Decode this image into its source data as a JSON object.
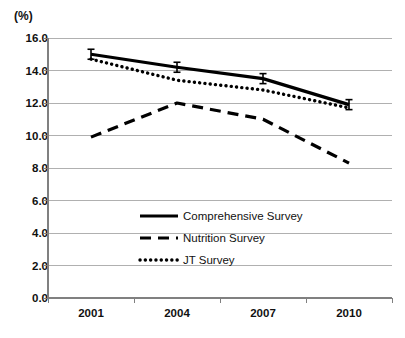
{
  "chart_data": {
    "type": "line",
    "title": "",
    "subtitle": "",
    "xlabel": "",
    "ylabel": "(%)",
    "unit_label": "(%)",
    "categories": [
      "2001",
      "2004",
      "2007",
      "2010"
    ],
    "x": [
      2001,
      2004,
      2007,
      2010
    ],
    "ylim": [
      0.0,
      16.0
    ],
    "ytick_values": [
      0.0,
      2.0,
      4.0,
      6.0,
      8.0,
      10.0,
      12.0,
      14.0,
      16.0
    ],
    "ytick_labels": [
      "0.0",
      "2.0",
      "4.0",
      "6.0",
      "8.0",
      "10.0",
      "12.0",
      "14.0",
      "16.0"
    ],
    "grid": true,
    "grid_axis": "y",
    "legend_position": "inside-center-lower",
    "series": [
      {
        "name": "Comprehensive Survey",
        "style": "solid",
        "color": "#000000",
        "has_error_bars": true,
        "values": [
          15.0,
          14.2,
          13.5,
          11.9
        ]
      },
      {
        "name": "Nutrition Survey",
        "style": "dashed",
        "color": "#000000",
        "has_error_bars": false,
        "values": [
          9.9,
          12.0,
          11.0,
          8.3
        ]
      },
      {
        "name": "JT Survey",
        "style": "dotted",
        "color": "#000000",
        "has_error_bars": false,
        "values": [
          14.7,
          13.4,
          12.8,
          11.7
        ]
      }
    ]
  },
  "legend": {
    "entries": [
      {
        "label": "Comprehensive Survey",
        "style": "solid"
      },
      {
        "label": "Nutrition Survey",
        "style": "dashed"
      },
      {
        "label": "JT Survey",
        "style": "dotted"
      }
    ]
  },
  "colors": {
    "series": "#000000",
    "grid": "#b0b0b0",
    "axis": "#808080",
    "text": "#111111",
    "background": "#ffffff"
  }
}
